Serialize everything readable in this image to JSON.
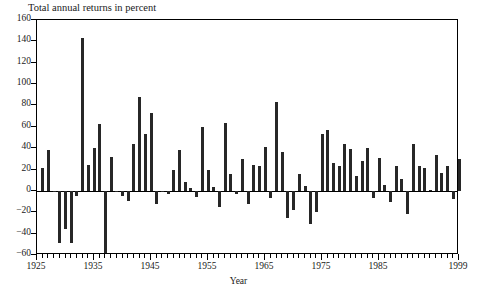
{
  "chart_data": {
    "type": "bar",
    "title": "Total annual returns in percent",
    "xlabel": "Year",
    "ylabel": "",
    "ylim": [
      -60,
      160
    ],
    "xlim": [
      1925,
      1999
    ],
    "ytick_step": 20,
    "yticks": [
      -60,
      -40,
      -20,
      0,
      20,
      40,
      60,
      80,
      100,
      120,
      140,
      160
    ],
    "ytick_labels": [
      "−60",
      "−40",
      "−20",
      "0",
      "20",
      "40",
      "60",
      "80",
      "100",
      "120",
      "140",
      "160"
    ],
    "xticks": [
      1925,
      1935,
      1945,
      1955,
      1965,
      1975,
      1985,
      1999
    ],
    "xtick_labels": [
      "1925",
      "1935",
      "1945",
      "1955",
      "1965",
      "1975",
      "1985",
      "1999"
    ],
    "xtick_minor_step": 1,
    "grid": false,
    "legend": null,
    "bar_color": "#272727",
    "series_name": "Total annual returns",
    "categories": [
      1926,
      1927,
      1928,
      1929,
      1930,
      1931,
      1932,
      1933,
      1934,
      1935,
      1936,
      1937,
      1938,
      1939,
      1940,
      1941,
      1942,
      1943,
      1944,
      1945,
      1946,
      1947,
      1948,
      1949,
      1950,
      1951,
      1952,
      1953,
      1954,
      1955,
      1956,
      1957,
      1958,
      1959,
      1960,
      1961,
      1962,
      1963,
      1964,
      1965,
      1966,
      1967,
      1968,
      1969,
      1970,
      1971,
      1972,
      1973,
      1974,
      1975,
      1976,
      1977,
      1978,
      1979,
      1980,
      1981,
      1982,
      1983,
      1984,
      1985,
      1986,
      1987,
      1988,
      1989,
      1990,
      1991,
      1992,
      1993,
      1994,
      1995,
      1996,
      1997,
      1998,
      1999
    ],
    "values": [
      21,
      38,
      -1,
      -49,
      -36,
      -49,
      -5,
      143,
      24,
      40,
      63,
      -58,
      32,
      -1,
      -5,
      -9,
      44,
      88,
      53,
      73,
      -12,
      0,
      -3,
      20,
      38,
      8,
      3,
      -6,
      60,
      20,
      4,
      -15,
      64,
      16,
      -3,
      30,
      -12,
      24,
      23,
      41,
      -7,
      83,
      36,
      -25,
      -18,
      16,
      5,
      -31,
      -20,
      53,
      57,
      26,
      23,
      44,
      39,
      14,
      28,
      40,
      -7,
      31,
      6,
      -10,
      23,
      11,
      -22,
      44,
      23,
      21,
      1,
      34,
      17,
      23,
      -8,
      30
    ]
  }
}
